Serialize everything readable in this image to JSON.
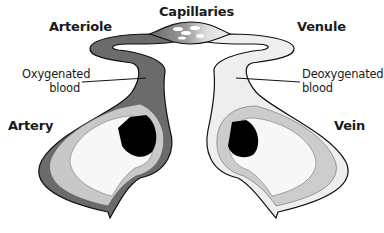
{
  "diagram": {
    "labels": {
      "capillaries": "Capillaries",
      "arteriole": "Arteriole",
      "venule": "Venule",
      "artery": "Artery",
      "vein": "Vein",
      "oxygenated_line1": "Oxygenated",
      "oxygenated_line2": "blood",
      "deoxygenated_line1": "Deoxygenated",
      "deoxygenated_line2": "blood"
    },
    "colors": {
      "oxygenated_fill": "#6b6b6b",
      "deoxygenated_fill": "#eeeeee",
      "muscle_layer": "#c8c8c8",
      "lumen": "#000000",
      "outline": "#111111"
    }
  }
}
